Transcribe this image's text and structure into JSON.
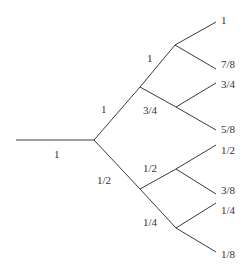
{
  "diagram": {
    "type": "binary-tree",
    "edge_color": "#3a3a3a",
    "text_color": "#333333",
    "edges": [
      {
        "id": "root",
        "label": "1"
      },
      {
        "id": "upper",
        "label": "1"
      },
      {
        "id": "lower",
        "label": "1/2"
      },
      {
        "id": "upper-upper",
        "label": "1"
      },
      {
        "id": "upper-lower",
        "label": "3/4"
      },
      {
        "id": "lower-upper",
        "label": "1/2"
      },
      {
        "id": "lower-lower",
        "label": "1/4"
      }
    ],
    "leaves": [
      "1",
      "7/8",
      "3/4",
      "5/8",
      "1/2",
      "3/8",
      "1/4",
      "1/8"
    ]
  }
}
